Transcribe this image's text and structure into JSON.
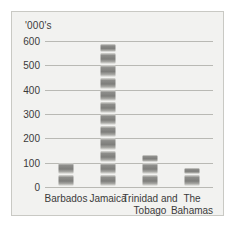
{
  "figure": {
    "unit_label": "'000's",
    "background_color": "#f2f2f0",
    "border_color": "#c9c9c4",
    "bar_color": "#8d8d8a",
    "gridline_color": "#b9b9b4"
  },
  "chart_data": {
    "type": "bar",
    "title": "",
    "subtitle": "",
    "xlabel": "",
    "ylabel": "'000's",
    "categories": [
      "Barbados",
      "Jamaica",
      "Trinidad and Tobago",
      "The Bahamas"
    ],
    "values": [
      100,
      590,
      130,
      80
    ],
    "ylim": [
      0,
      600
    ],
    "yticks": [
      0,
      100,
      200,
      300,
      400,
      500,
      600
    ],
    "ytick_labels": [
      "0",
      "100",
      "200",
      "300",
      "400",
      "500",
      "600"
    ],
    "grid": true,
    "legend": null,
    "legend_position": "none",
    "annotations": [],
    "bar_style": "segmented-blocks",
    "segment_size": 50
  }
}
